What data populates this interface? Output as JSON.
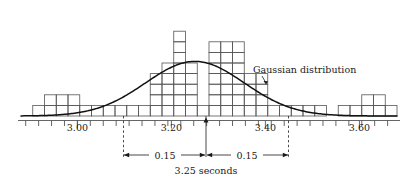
{
  "figure": {
    "name": "histogram-with-gaussian-overlay",
    "colors": {
      "ink": "#1a1a1a",
      "bar_stroke": "#555555",
      "curve": "#111111",
      "background": "#ffffff"
    }
  },
  "chart_data": {
    "type": "bar",
    "title": "",
    "xlabel": "",
    "ylabel": "",
    "grid": false,
    "legend_position": "inline-annotation",
    "xlim": [
      2.88,
      3.68
    ],
    "ylim": [
      0,
      9
    ],
    "bin_width": 0.025,
    "bin_starts": [
      2.88,
      2.905,
      2.93,
      2.955,
      2.98,
      3.005,
      3.03,
      3.055,
      3.08,
      3.105,
      3.13,
      3.155,
      3.18,
      3.205,
      3.23,
      3.255,
      3.28,
      3.305,
      3.33,
      3.355,
      3.38,
      3.405,
      3.43,
      3.455,
      3.48,
      3.505,
      3.53,
      3.555,
      3.58,
      3.605,
      3.63,
      3.655
    ],
    "categories": [
      "2.88",
      "2.91",
      "2.93",
      "2.96",
      "2.98",
      "3.01",
      "3.03",
      "3.06",
      "3.08",
      "3.11",
      "3.13",
      "3.16",
      "3.18",
      "3.21",
      "3.23",
      "3.26",
      "3.28",
      "3.31",
      "3.33",
      "3.36",
      "3.38",
      "3.41",
      "3.43",
      "3.46",
      "3.48",
      "3.51",
      "3.53",
      "3.56",
      "3.58",
      "3.61",
      "3.63",
      "3.66"
    ],
    "values": [
      0,
      1,
      2,
      2,
      2,
      1,
      1,
      1,
      1,
      1,
      1,
      4,
      5,
      8,
      5,
      1,
      7,
      7,
      7,
      4,
      4,
      1,
      1,
      1,
      1,
      1,
      0,
      1,
      1,
      2,
      2,
      1
    ],
    "series": [
      {
        "name": "Histogram of measured times",
        "values": [
          0,
          1,
          2,
          2,
          2,
          1,
          1,
          1,
          1,
          1,
          1,
          4,
          5,
          8,
          5,
          1,
          7,
          7,
          7,
          4,
          4,
          1,
          1,
          1,
          1,
          1,
          0,
          1,
          1,
          2,
          2,
          1
        ]
      },
      {
        "name": "Gaussian distribution",
        "type": "line",
        "mean": 3.25,
        "sigma": 0.105,
        "peak_value": 5.15
      }
    ],
    "xticks_major": [
      3.0,
      3.2,
      3.4,
      3.6
    ],
    "xtick_major_labels": [
      "3.00",
      "3.20",
      "3.40",
      "3.60"
    ],
    "annotations": [
      {
        "name": "curve-label",
        "text": "Gaussian distribution"
      },
      {
        "name": "left-span-label",
        "text": "0.15"
      },
      {
        "name": "right-span-label",
        "text": "0.15"
      },
      {
        "name": "center-label",
        "text": "3.25  seconds"
      }
    ]
  },
  "labels": {
    "xtick_0": "3.00",
    "xtick_1": "3.20",
    "xtick_2": "3.40",
    "xtick_3": "3.60",
    "curve": "Gaussian distribution",
    "span_left": "0.15",
    "span_right": "0.15",
    "center": "3.25  seconds"
  }
}
